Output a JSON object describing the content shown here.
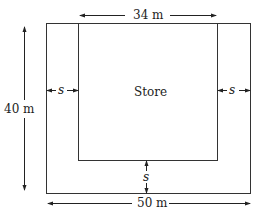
{
  "diagram": {
    "store_label": "Store",
    "top_dimension": "34 m",
    "side_dimension": "40 m",
    "bottom_dimension": "50 m",
    "left_gap": "s",
    "right_gap": "s",
    "bottom_gap": "s"
  }
}
